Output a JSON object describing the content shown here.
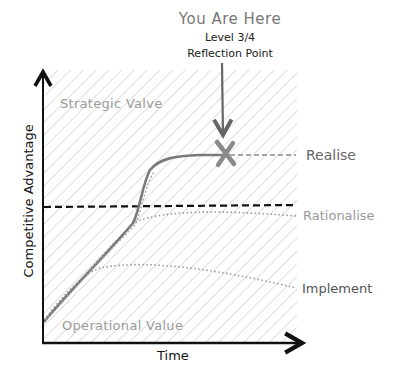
{
  "callout": {
    "title": "You Are Here",
    "level": "Level 3/4",
    "subtitle": "Reflection Point"
  },
  "regions": {
    "upper": "Strategic Valve",
    "lower": "Operational Value"
  },
  "axes": {
    "x_label": "Time",
    "y_label": "Competitive Advantage"
  },
  "curves": [
    {
      "label": "Realise",
      "style": "solid+dashed",
      "color": "#777777"
    },
    {
      "label": "Rationalise",
      "style": "dotted",
      "color": "#999999"
    },
    {
      "label": "Implement",
      "style": "dotted",
      "color": "#999999"
    }
  ],
  "threshold_line": {
    "style": "dashed",
    "color": "#111111"
  },
  "marker": {
    "type": "x-mark",
    "color": "#888888"
  },
  "colors": {
    "hatch": "#d6d6d6",
    "axis": "#111111",
    "curve": "#7a7a7a",
    "arrow": "#666666"
  }
}
